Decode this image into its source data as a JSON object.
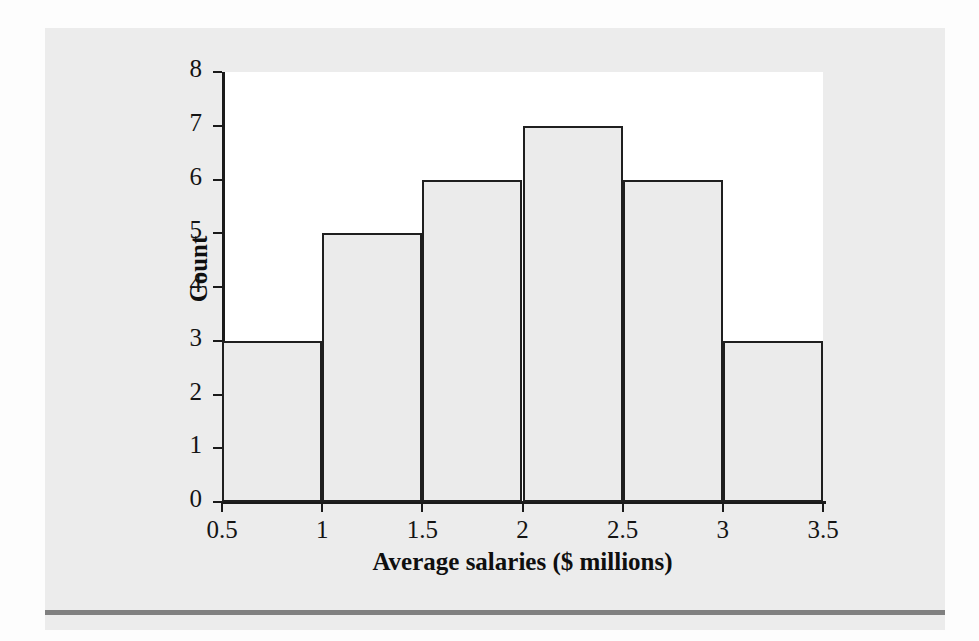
{
  "page": {
    "background_color": "#fdfdfd",
    "panel_color": "#ececec",
    "rule_color": "#808080",
    "bleed_through_text": "of a profession. Compare\nthe distribution with that\nof the population, then\nanswer the question.\nThe histogram below shows"
  },
  "chart_data": {
    "type": "bar",
    "title": "",
    "subtitle": "",
    "xlabel": "Average salaries ($ millions)",
    "ylabel": "Count",
    "categories": [
      "0.5-1",
      "1-1.5",
      "1.5-2",
      "2-2.5",
      "2.5-3",
      "3-3.5"
    ],
    "bin_edges": [
      0.5,
      1,
      1.5,
      2,
      2.5,
      3,
      3.5
    ],
    "bin_width": 0.5,
    "values": [
      3,
      5,
      6,
      7,
      6,
      3
    ],
    "x_tick_labels": [
      "0.5",
      "1",
      "1.5",
      "2",
      "2.5",
      "3",
      "3.5"
    ],
    "x_tick_values": [
      0.5,
      1,
      1.5,
      2,
      2.5,
      3,
      3.5
    ],
    "y_tick_labels": [
      "0",
      "1",
      "2",
      "3",
      "4",
      "5",
      "6",
      "7",
      "8"
    ],
    "y_tick_values": [
      0,
      1,
      2,
      3,
      4,
      5,
      6,
      7,
      8
    ],
    "xlim": [
      0.5,
      3.5
    ],
    "ylim": [
      0,
      8
    ],
    "grid": false,
    "legend": false,
    "bar_fill_color": "#ebebeb",
    "bar_edge_color": "#1f1f1f",
    "plot_background": "#ffffff",
    "total_count": 30
  }
}
